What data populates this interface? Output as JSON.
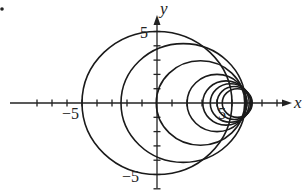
{
  "figure": {
    "axes": {
      "x_label": "x",
      "y_label": "y",
      "x_tick_label_neg": "−5",
      "x_tick_label_pos": "5",
      "y_tick_label_pos": "5",
      "y_tick_label_neg": "−5",
      "x_range": [
        -10,
        9.5
      ],
      "y_range": [
        -6,
        6.5
      ]
    },
    "circles": [
      {
        "cx": 0.0,
        "r": 5.0
      },
      {
        "cx": 1.75,
        "r": 4.15
      },
      {
        "cx": 2.9,
        "r": 2.95
      },
      {
        "cx": 4.0,
        "r": 2.0
      },
      {
        "cx": 4.6,
        "r": 1.55
      },
      {
        "cx": 4.9,
        "r": 1.35
      },
      {
        "cx": 5.15,
        "r": 1.15
      },
      {
        "cx": 5.35,
        "r": 1.0
      }
    ],
    "colors": {
      "stroke": "#1a1a1a",
      "background": "#ffffff"
    }
  }
}
